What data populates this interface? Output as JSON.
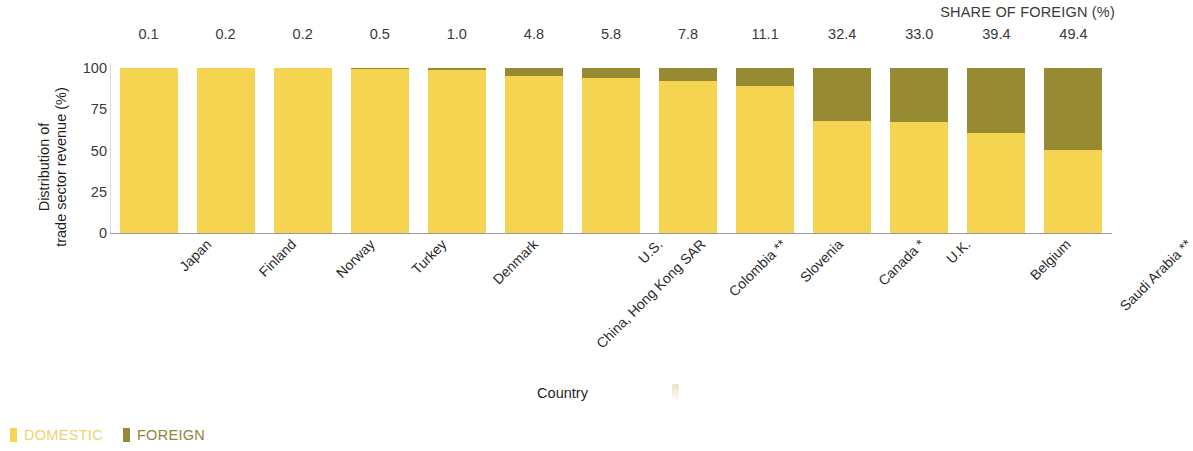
{
  "header": {
    "share_of_foreign_title": "SHARE OF FOREIGN (%)"
  },
  "axes": {
    "y_title": "Distribution of\ntrade sector revenue (%)",
    "x_title": "Country",
    "y_ticks": [
      "100",
      "75",
      "50",
      "25",
      "0"
    ]
  },
  "legend": {
    "domestic_label": "DOMESTIC",
    "foreign_label": "FOREIGN",
    "domestic_color": "#f5d451",
    "foreign_color": "#968a33"
  },
  "chart_data": {
    "type": "bar",
    "subtype": "stacked-100-percent",
    "title": "",
    "xlabel": "Country",
    "ylabel": "Distribution of trade sector revenue (%)",
    "ylim": [
      0,
      100
    ],
    "yticks": [
      0,
      25,
      50,
      75,
      100
    ],
    "grid": false,
    "legend_position": "bottom-left",
    "categories": [
      "Japan",
      "Finland",
      "Norway",
      "Turkey",
      "Denmark",
      "China, Hong Kong SAR",
      "U.S.",
      "Colombia **",
      "Slovenia",
      "Canada *",
      "U.K.",
      "Belgium",
      "Saudi Arabia **"
    ],
    "series": [
      {
        "name": "DOMESTIC",
        "color": "#f5d451",
        "values": [
          99.9,
          99.8,
          99.8,
          99.5,
          99.0,
          95.2,
          94.2,
          92.2,
          88.9,
          67.6,
          67.0,
          60.6,
          50.6
        ]
      },
      {
        "name": "FOREIGN",
        "color": "#968a33",
        "values": [
          0.1,
          0.2,
          0.2,
          0.5,
          1.0,
          4.8,
          5.8,
          7.8,
          11.1,
          32.4,
          33.0,
          39.4,
          49.4
        ]
      }
    ],
    "data_labels": {
      "label": "SHARE OF FOREIGN (%)",
      "values": [
        "0.1",
        "0.2",
        "0.2",
        "0.5",
        "1.0",
        "4.8",
        "5.8",
        "7.8",
        "11.1",
        "32.4",
        "33.0",
        "39.4",
        "49.4"
      ]
    }
  }
}
